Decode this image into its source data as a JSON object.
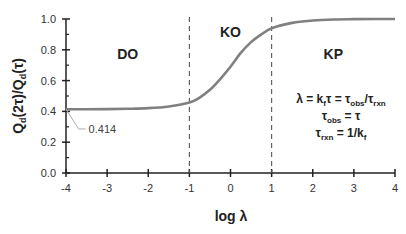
{
  "chart_data": {
    "type": "line",
    "title": "",
    "xlabel": "log λ",
    "ylabel": "Q_d(2τ)/Q_d(τ)",
    "xlim": [
      -4,
      4
    ],
    "ylim": [
      0.0,
      1.0
    ],
    "x_ticks": [
      "-4",
      "-3",
      "-2",
      "-1",
      "0",
      "1",
      "2",
      "3",
      "4"
    ],
    "y_ticks": [
      "0.0",
      "0.2",
      "0.4",
      "0.6",
      "0.8",
      "1.0"
    ],
    "grid": false,
    "legend": null,
    "series": [
      {
        "name": "Q_d(2τ)/Q_d(τ)",
        "color": "#808080",
        "x": [
          -4,
          -3.5,
          -3,
          -2.5,
          -2,
          -1.5,
          -1,
          -0.75,
          -0.5,
          -0.25,
          0,
          0.25,
          0.5,
          0.75,
          1,
          1.5,
          2,
          2.5,
          3,
          3.5,
          4
        ],
        "y": [
          0.414,
          0.414,
          0.415,
          0.417,
          0.421,
          0.432,
          0.457,
          0.49,
          0.54,
          0.61,
          0.69,
          0.78,
          0.85,
          0.9,
          0.94,
          0.975,
          0.99,
          0.997,
          0.999,
          1.0,
          1.0
        ]
      }
    ],
    "vertical_lines": [
      {
        "x": -1,
        "style": "dashed"
      },
      {
        "x": 1,
        "style": "dashed"
      }
    ],
    "regions": [
      {
        "label": "DO",
        "x": -2.5,
        "y": 0.74
      },
      {
        "label": "KO",
        "x": 0,
        "y": 0.88
      },
      {
        "label": "KP",
        "x": 2.5,
        "y": 0.74
      }
    ],
    "annotations": [
      {
        "text": "0.414",
        "point": [
          -4,
          0.414
        ],
        "label_pos": [
          -3.45,
          0.26
        ]
      }
    ],
    "equations": [
      "λ = k_f τ = τ_obs/τ_rxn",
      "τ_obs = τ",
      "τ_rxn = 1/k_f"
    ]
  }
}
